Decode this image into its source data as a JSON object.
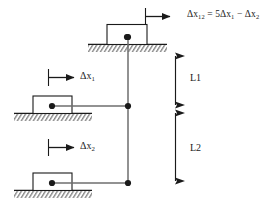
{
  "figure": {
    "type": "mechanics-cable-block-diagram",
    "background_color": "#ffffff",
    "line_color": "#1a1a1a",
    "cable_color": "#6e6e6e"
  },
  "equation": {
    "full_text": "Δx12 = 5Δx1 − Δx2",
    "lhs_symbol": "Δx",
    "lhs_subscript": "12",
    "equals": "=",
    "coefficient": "5",
    "term1_symbol": "Δx",
    "term1_subscript": "1",
    "operator": "−",
    "term2_symbol": "Δx",
    "term2_subscript": "2"
  },
  "blocks": [
    {
      "id": "top-block",
      "name": "top-block",
      "displacement_label_symbol": "",
      "displacement_label_subscript": "",
      "ground_position": "top",
      "has_arrow": true
    },
    {
      "id": "middle-block",
      "name": "middle-block",
      "displacement_label_symbol": "Δx",
      "displacement_label_subscript": "1",
      "ground_position": "middle",
      "has_arrow": true
    },
    {
      "id": "bottom-block",
      "name": "bottom-block",
      "displacement_label_symbol": "Δx",
      "displacement_label_subscript": "2",
      "ground_position": "bottom",
      "has_arrow": true
    }
  ],
  "dimensions": [
    {
      "id": "L1",
      "label": "L1",
      "description": "distance between top node and middle node",
      "arrow_style": "double-headed"
    },
    {
      "id": "L2",
      "label": "L2",
      "description": "distance between middle node and bottom node",
      "arrow_style": "double-headed"
    }
  ],
  "nodes": [
    {
      "id": "node-top",
      "name": "top-pin-node"
    },
    {
      "id": "node-middle",
      "name": "middle-pin-node"
    },
    {
      "id": "node-bottom",
      "name": "bottom-pin-node"
    }
  ]
}
